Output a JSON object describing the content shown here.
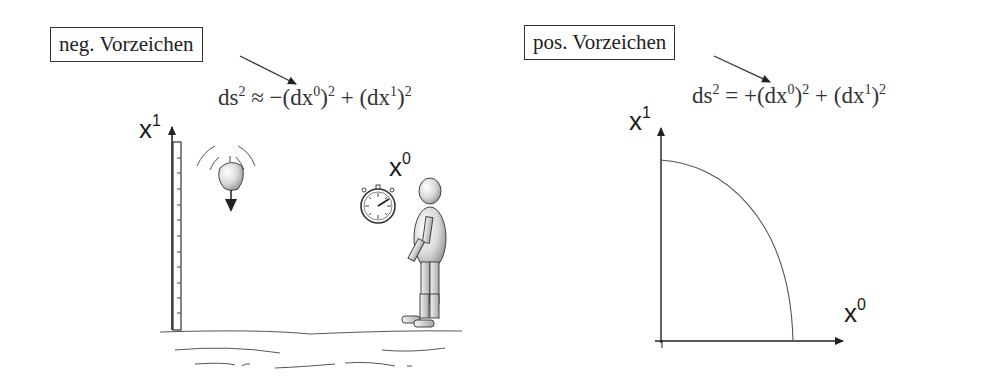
{
  "left_panel": {
    "callout": "neg. Vorzeichen",
    "formula": {
      "lhs": "ds",
      "lhs_exp": "2",
      "relation": "≈",
      "term1_sign": "−",
      "term1_base": "(dx",
      "term1_sup": "0",
      "term1_close": ")",
      "term1_exp": "2",
      "plus": "+",
      "term2_base": "(dx",
      "term2_sup": "1",
      "term2_close": ")",
      "term2_exp": "2"
    },
    "axis_vertical": {
      "base": "x",
      "sup": "1"
    },
    "axis_time": {
      "base": "x",
      "sup": "0"
    },
    "illustration": [
      "ruler",
      "falling-apple",
      "stopwatch",
      "mannequin-figure",
      "ground"
    ]
  },
  "right_panel": {
    "callout": "pos. Vorzeichen",
    "formula": {
      "lhs": "ds",
      "lhs_exp": "2",
      "relation": "=",
      "term1_sign": "+",
      "term1_base": "(dx",
      "term1_sup": "0",
      "term1_close": ")",
      "term1_exp": "2",
      "plus": "+",
      "term2_base": "(dx",
      "term2_sup": "1",
      "term2_close": ")",
      "term2_exp": "2"
    },
    "axis_vertical": {
      "base": "x",
      "sup": "1"
    },
    "axis_horizontal": {
      "base": "x",
      "sup": "0"
    },
    "curve": "quarter-circle"
  },
  "colors": {
    "ink": "#2a2a2a",
    "line": "#444444",
    "background": "#ffffff"
  }
}
